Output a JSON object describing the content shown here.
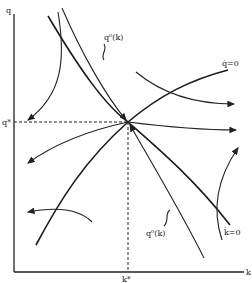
{
  "diagram": {
    "type": "phase-diagram",
    "axes": {
      "y_label": "q",
      "x_label": "k",
      "y_star_label": "q*",
      "x_star_label": "k*"
    },
    "curves": {
      "q_dot_zero": "q̇=0",
      "k_dot_zero": "k̇=0",
      "stable_arm_upper": "q⁰(k)",
      "stable_arm_lower": "q⁰(k)"
    },
    "colors": {
      "ink": "#222222",
      "background": "#ffffff"
    }
  }
}
